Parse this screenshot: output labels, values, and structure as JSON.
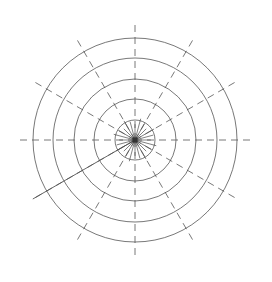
{
  "figure": {
    "title": "",
    "background_color": "#ffffff",
    "width": 272,
    "height": 282
  },
  "chart_data": {
    "type": "line",
    "subtype": "polar-grid",
    "title": "",
    "subtitle": "",
    "xlabel": "",
    "ylabel": "",
    "grid": true,
    "legend": false,
    "legend_position": "none",
    "center": {
      "x": 135,
      "y": 140
    },
    "radial_axis": {
      "label": "",
      "range": [
        0,
        5
      ],
      "tick_labels": [],
      "ring_count": 5,
      "ring_radii_px": [
        20,
        41,
        61,
        82,
        102
      ],
      "ring_values": [
        1,
        2,
        3,
        4,
        5
      ],
      "ring_color": "#555555",
      "ring_width": 0.8,
      "ring_style": "solid"
    },
    "angular_axis": {
      "label": "",
      "spoke_count": 12,
      "spoke_step_degrees": 30,
      "tick_labels": [],
      "spoke_angles_degrees": [
        0,
        30,
        60,
        90,
        120,
        150,
        180,
        210,
        240,
        270,
        300,
        330
      ],
      "spoke_color": "#555555",
      "spoke_width": 0.8,
      "spoke_style": "dashed",
      "spoke_dash_pattern": "7 5",
      "spoke_outer_radius_px": 115,
      "spoke_inner_radius_px": 0
    },
    "highlight_spoke": {
      "angle_degrees": 210,
      "style": "solid",
      "color": "#555555",
      "width": 0.9,
      "outer_radius_px": 118,
      "description": "solid radial line lower-left"
    },
    "hub": {
      "description": "dense solid short radial lines near origin",
      "ray_count": 24,
      "ray_radius_px": 22,
      "ray_color": "#4a4a4a",
      "ray_width": 0.7,
      "marker": {
        "shape": "square",
        "size_px": 5,
        "color": "#333333"
      }
    }
  }
}
